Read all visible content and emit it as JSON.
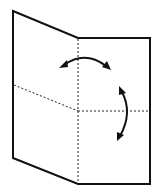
{
  "diagram": {
    "type": "origami-fold-instruction",
    "colors": {
      "background": "#ffffff",
      "line": "#111111"
    },
    "outline_points": [
      [
        13,
        11
      ],
      [
        78,
        38
      ],
      [
        150,
        38
      ],
      [
        150,
        184
      ],
      [
        78,
        184
      ],
      [
        13,
        158
      ]
    ],
    "creases": {
      "vertical": {
        "from": [
          78,
          38
        ],
        "to": [
          78,
          184
        ],
        "style": "dotted"
      },
      "horizontal_left": {
        "from": [
          13,
          85
        ],
        "to": [
          78,
          111
        ],
        "style": "dotted"
      },
      "horizontal_right": {
        "from": [
          78,
          111
        ],
        "to": [
          150,
          111
        ],
        "style": "dotted"
      }
    },
    "arrows": [
      {
        "name": "horizontal-fold-arrow",
        "direction": "double-headed",
        "from": [
          60,
          67
        ],
        "to": [
          110,
          69
        ]
      },
      {
        "name": "vertical-fold-arrow",
        "direction": "double-headed",
        "from": [
          120,
          87
        ],
        "to": [
          117,
          140
        ]
      }
    ]
  }
}
